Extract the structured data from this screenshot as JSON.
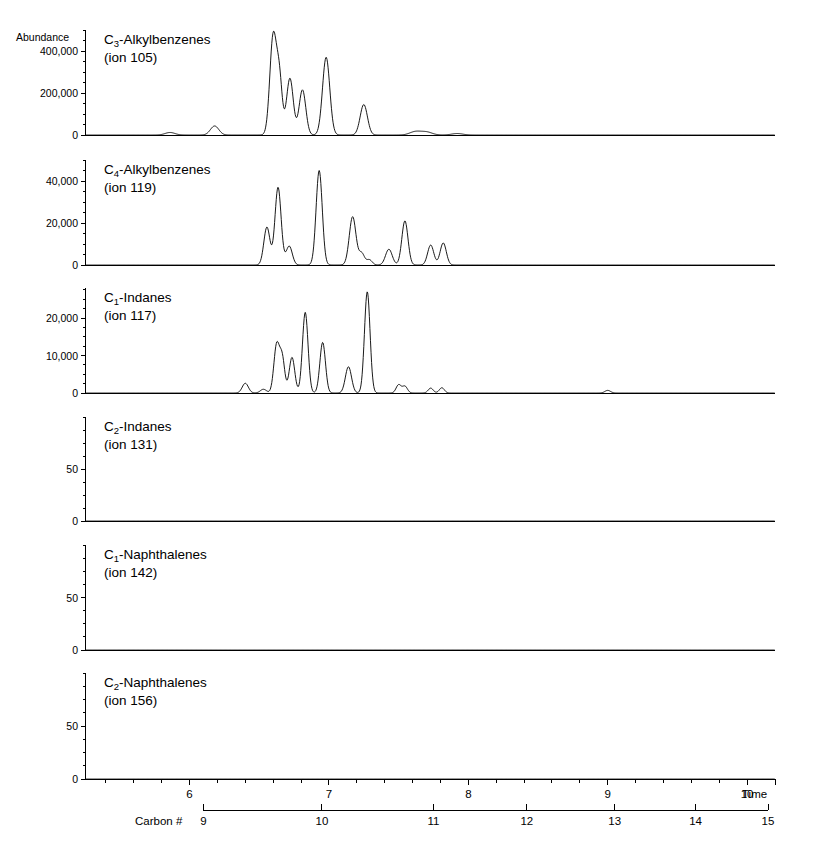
{
  "figure": {
    "abundance_label": "Abundance",
    "time_axis_label": "Time",
    "carbon_axis_label": "Carbon #"
  },
  "chart_data": {
    "type": "line",
    "title": "",
    "xlabel": "Time",
    "secondary_xlabel": "Carbon #",
    "ylabel": "Abundance",
    "grid": false,
    "legend_position": "inside-panel",
    "xlim": [
      5.25,
      10.2
    ],
    "x_ticks": [
      6,
      7,
      8,
      9,
      10
    ],
    "x_minor_tick_step": 0.2,
    "carbon_axis": {
      "ticks": [
        9,
        10,
        11,
        12,
        13,
        14,
        15
      ],
      "tick_time_positions": [
        6.1,
        6.95,
        7.75,
        8.42,
        9.05,
        9.63,
        10.15
      ],
      "start_time": 6.1,
      "end_time": 10.15
    },
    "panels": [
      {
        "name": "C3-Alkylbenzenes",
        "label_line1_prefix": "C",
        "label_line1_sub": "3",
        "label_line1_suffix": "-Alkylbenzenes",
        "label_line2": "(ion 105)",
        "ion": 105,
        "ylim": [
          0,
          500000
        ],
        "y_ticks": [
          0,
          200000,
          400000
        ],
        "y_tick_labels": [
          "0",
          "200,000",
          "400,000"
        ],
        "y_minor_tick_step": 50000,
        "peaks": [
          {
            "t": 5.86,
            "h": 12000,
            "w": 0.035
          },
          {
            "t": 6.18,
            "h": 43000,
            "w": 0.03
          },
          {
            "t": 6.6,
            "h": 470000,
            "w": 0.024
          },
          {
            "t": 6.645,
            "h": 255000,
            "w": 0.02
          },
          {
            "t": 6.72,
            "h": 270000,
            "w": 0.024
          },
          {
            "t": 6.81,
            "h": 215000,
            "w": 0.024
          },
          {
            "t": 6.98,
            "h": 370000,
            "w": 0.026
          },
          {
            "t": 7.25,
            "h": 145000,
            "w": 0.026
          },
          {
            "t": 7.62,
            "h": 16000,
            "w": 0.04
          },
          {
            "t": 7.7,
            "h": 14000,
            "w": 0.04
          },
          {
            "t": 7.92,
            "h": 7000,
            "w": 0.04
          }
        ]
      },
      {
        "name": "C4-Alkylbenzenes",
        "label_line1_prefix": "C",
        "label_line1_sub": "4",
        "label_line1_suffix": "-Alkylbenzenes",
        "label_line2": "(ion 119)",
        "ion": 119,
        "ylim": [
          0,
          50000
        ],
        "y_ticks": [
          0,
          20000,
          40000
        ],
        "y_tick_labels": [
          "0",
          "20,000",
          "40,000"
        ],
        "y_minor_tick_step": 5000,
        "peaks": [
          {
            "t": 6.555,
            "h": 18000,
            "w": 0.022
          },
          {
            "t": 6.635,
            "h": 37000,
            "w": 0.022
          },
          {
            "t": 6.715,
            "h": 9000,
            "w": 0.022
          },
          {
            "t": 6.93,
            "h": 45000,
            "w": 0.022
          },
          {
            "t": 7.17,
            "h": 23000,
            "w": 0.024
          },
          {
            "t": 7.235,
            "h": 5500,
            "w": 0.02
          },
          {
            "t": 7.29,
            "h": 2500,
            "w": 0.02
          },
          {
            "t": 7.43,
            "h": 7500,
            "w": 0.024
          },
          {
            "t": 7.545,
            "h": 21000,
            "w": 0.022
          },
          {
            "t": 7.73,
            "h": 9500,
            "w": 0.022
          },
          {
            "t": 7.82,
            "h": 10500,
            "w": 0.022
          }
        ]
      },
      {
        "name": "C1-Indanes",
        "label_line1_prefix": "C",
        "label_line1_sub": "1",
        "label_line1_suffix": "-Indanes",
        "label_line2": "(ion 117)",
        "ion": 117,
        "ylim": [
          0,
          28000
        ],
        "y_ticks": [
          0,
          10000,
          20000
        ],
        "y_tick_labels": [
          "0",
          "10,000",
          "20,000"
        ],
        "y_minor_tick_step": 2500,
        "peaks": [
          {
            "t": 6.4,
            "h": 2600,
            "w": 0.022
          },
          {
            "t": 6.53,
            "h": 1000,
            "w": 0.022
          },
          {
            "t": 6.625,
            "h": 12800,
            "w": 0.02
          },
          {
            "t": 6.665,
            "h": 9000,
            "w": 0.018
          },
          {
            "t": 6.735,
            "h": 9500,
            "w": 0.02
          },
          {
            "t": 6.83,
            "h": 21500,
            "w": 0.02
          },
          {
            "t": 6.955,
            "h": 13500,
            "w": 0.02
          },
          {
            "t": 7.14,
            "h": 7000,
            "w": 0.022
          },
          {
            "t": 7.275,
            "h": 27000,
            "w": 0.02
          },
          {
            "t": 7.5,
            "h": 2200,
            "w": 0.018
          },
          {
            "t": 7.545,
            "h": 1800,
            "w": 0.018
          },
          {
            "t": 7.73,
            "h": 1300,
            "w": 0.018
          },
          {
            "t": 7.81,
            "h": 1400,
            "w": 0.018
          },
          {
            "t": 9.0,
            "h": 700,
            "w": 0.02
          }
        ]
      },
      {
        "name": "C2-Indanes",
        "label_line1_prefix": "C",
        "label_line1_sub": "2",
        "label_line1_suffix": "-Indanes",
        "label_line2": "(ion 131)",
        "ion": 131,
        "ylim": [
          0,
          100
        ],
        "y_ticks": [
          0,
          50
        ],
        "y_tick_labels": [
          "0",
          "50"
        ],
        "y_minor_tick_step": 12.5,
        "peaks": []
      },
      {
        "name": "C1-Naphthalenes",
        "label_line1_prefix": "C",
        "label_line1_sub": "1",
        "label_line1_suffix": "-Naphthalenes",
        "label_line2": "(ion 142)",
        "ion": 142,
        "ylim": [
          0,
          100
        ],
        "y_ticks": [
          0,
          50
        ],
        "y_tick_labels": [
          "0",
          "50"
        ],
        "y_minor_tick_step": 12.5,
        "peaks": []
      },
      {
        "name": "C2-Naphthalenes",
        "label_line1_prefix": "C",
        "label_line1_sub": "2",
        "label_line1_suffix": "-Naphthalenes",
        "label_line2": "(ion 156)",
        "ion": 156,
        "ylim": [
          0,
          100
        ],
        "y_ticks": [
          0,
          50
        ],
        "y_tick_labels": [
          "0",
          "50"
        ],
        "y_minor_tick_step": 12.5,
        "peaks": []
      }
    ]
  }
}
